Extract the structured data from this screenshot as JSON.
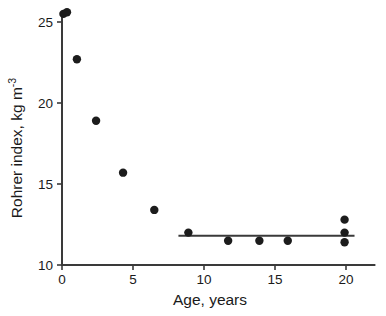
{
  "chart_data": {
    "type": "scatter",
    "title": "",
    "xlabel": "Age, years",
    "ylabel": "Rohrer index, kg m",
    "ylabel_superscript": "-3",
    "ylabel_full": "Rohrer index, kg m-3",
    "xlim": [
      0,
      22
    ],
    "ylim": [
      10,
      26
    ],
    "xticks": [
      0,
      5,
      10,
      15,
      20
    ],
    "xtick_labels": [
      "0",
      "5",
      "10",
      "15",
      "20"
    ],
    "yticks": [
      10,
      15,
      20,
      25
    ],
    "ytick_labels": [
      "10",
      "15",
      "20",
      "25"
    ],
    "grid": false,
    "legend": false,
    "marker": "filled-circle",
    "marker_color": "#1c1c1c",
    "axis_color": "#3a3a3a",
    "x": [
      0.1,
      0.35,
      1.05,
      2.4,
      4.3,
      6.5,
      8.9,
      11.7,
      13.9,
      15.9,
      19.9,
      19.9,
      19.9
    ],
    "y": [
      25.5,
      25.6,
      22.7,
      18.9,
      15.7,
      13.4,
      12.0,
      11.5,
      11.5,
      11.5,
      12.8,
      12.0,
      11.4
    ],
    "points": [
      {
        "x": 0.1,
        "y": 25.5
      },
      {
        "x": 0.35,
        "y": 25.6
      },
      {
        "x": 1.05,
        "y": 22.7
      },
      {
        "x": 2.4,
        "y": 18.9
      },
      {
        "x": 4.3,
        "y": 15.7
      },
      {
        "x": 6.5,
        "y": 13.4
      },
      {
        "x": 8.9,
        "y": 12.0
      },
      {
        "x": 11.7,
        "y": 11.5
      },
      {
        "x": 13.9,
        "y": 11.5
      },
      {
        "x": 15.9,
        "y": 11.5
      },
      {
        "x": 19.9,
        "y": 12.8
      },
      {
        "x": 19.9,
        "y": 12.0
      },
      {
        "x": 19.9,
        "y": 11.4
      }
    ],
    "annotations": [
      {
        "type": "horizontal-line",
        "x_start": 8.2,
        "x_end": 20.6,
        "y": 11.8,
        "label": "plateau-fit-line"
      }
    ]
  }
}
